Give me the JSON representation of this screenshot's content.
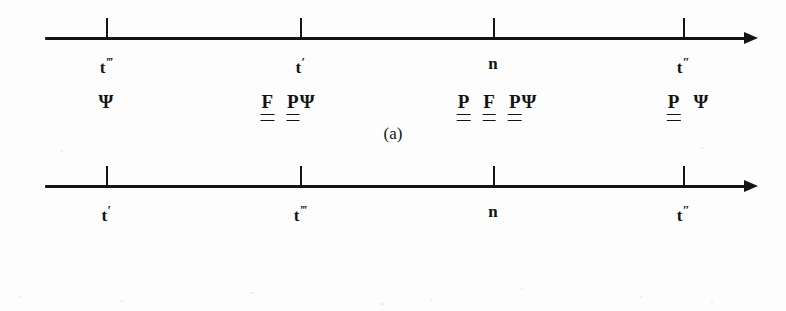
{
  "figure": {
    "background_color": "#fdfdfd",
    "ink_color": "#141414",
    "panels": [
      {
        "id": "a",
        "caption": "(a)",
        "axis": {
          "arrow_direction": "right",
          "tick_positions_px": [
            106,
            300,
            493,
            683
          ]
        },
        "points": [
          {
            "label_base": "t",
            "label_prime": "‴",
            "label_full": "t‴",
            "x_px": 106,
            "formula_x_px": 106,
            "symbols": [
              {
                "glyph": "Ψ",
                "double_underline": false,
                "tight": false
              }
            ]
          },
          {
            "label_base": "t",
            "label_prime": "′",
            "label_full": "t′",
            "x_px": 300,
            "formula_x_px": 288,
            "symbols": [
              {
                "glyph": "F",
                "double_underline": true,
                "tight": false
              },
              {
                "glyph": "P",
                "double_underline": true,
                "tight": true
              },
              {
                "glyph": "Ψ",
                "double_underline": false,
                "tight": false
              }
            ]
          },
          {
            "label_base": "n",
            "label_prime": "",
            "label_full": "n",
            "x_px": 493,
            "formula_x_px": 497,
            "symbols": [
              {
                "glyph": "P",
                "double_underline": true,
                "tight": false
              },
              {
                "glyph": "F",
                "double_underline": true,
                "tight": false
              },
              {
                "glyph": "P",
                "double_underline": true,
                "tight": true
              },
              {
                "glyph": "Ψ",
                "double_underline": false,
                "tight": false
              }
            ]
          },
          {
            "label_base": "t",
            "label_prime": "″",
            "label_full": "t″",
            "x_px": 683,
            "formula_x_px": 688,
            "symbols": [
              {
                "glyph": "P",
                "double_underline": true,
                "tight": false
              },
              {
                "glyph": "Ψ",
                "double_underline": false,
                "tight": false
              }
            ]
          }
        ]
      },
      {
        "id": "b",
        "caption": "(b)",
        "axis": {
          "arrow_direction": "right",
          "tick_positions_px": [
            106,
            300,
            493,
            683
          ]
        },
        "points": [
          {
            "label_base": "t",
            "label_prime": "′",
            "label_full": "t′",
            "x_px": 106,
            "formula_x_px": 113,
            "symbols": [
              {
                "glyph": "F",
                "double_underline": true,
                "tight": false
              },
              {
                "glyph": "P",
                "double_underline": true,
                "tight": false
              },
              {
                "glyph": "Ψ",
                "double_underline": false,
                "tight": false
              }
            ]
          },
          {
            "label_base": "t",
            "label_prime": "‴",
            "label_full": "t‴",
            "x_px": 300,
            "formula_x_px": 296,
            "symbols": [
              {
                "glyph": "Ψ",
                "double_underline": false,
                "tight": false
              }
            ]
          },
          {
            "label_base": "n",
            "label_prime": "",
            "label_full": "n",
            "x_px": 493,
            "formula_x_px": 497,
            "symbols": [
              {
                "glyph": "P",
                "double_underline": true,
                "tight": false
              },
              {
                "glyph": "F",
                "double_underline": true,
                "tight": false
              },
              {
                "glyph": "P",
                "double_underline": true,
                "tight": true
              },
              {
                "glyph": "Ψ",
                "double_underline": false,
                "tight": false
              }
            ]
          },
          {
            "label_base": "t",
            "label_prime": "″",
            "label_full": "t″",
            "x_px": 683,
            "formula_x_px": 688,
            "symbols": [
              {
                "glyph": "P",
                "double_underline": true,
                "tight": false
              },
              {
                "glyph": "Ψ",
                "double_underline": false,
                "tight": false
              }
            ]
          }
        ]
      }
    ]
  }
}
